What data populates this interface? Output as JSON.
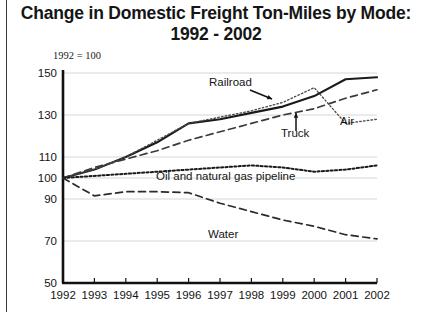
{
  "title": {
    "line1": "Change in Domestic Freight Ton-Miles by Mode:",
    "line2": "1992 - 2002"
  },
  "note": "1992 = 100",
  "chart_data": {
    "type": "line",
    "title": "Change in Domestic Freight Ton-Miles by Mode: 1992 - 2002",
    "subtitle": "1992 = 100",
    "xlabel": "",
    "ylabel": "",
    "grid": true,
    "legend_position": "inline-annotations",
    "x": [
      1992,
      1993,
      1994,
      1995,
      1996,
      1997,
      1998,
      1999,
      2000,
      2001,
      2002
    ],
    "xlim": [
      1992,
      2002
    ],
    "ylim": [
      50,
      150
    ],
    "yticks": [
      50,
      70,
      90,
      100,
      110,
      130,
      150
    ],
    "xticks": [
      "1992",
      "1993",
      "1994",
      "1995",
      "1996",
      "1997",
      "1998",
      "1999",
      "2000",
      "2001",
      "2002"
    ],
    "series": [
      {
        "name": "Railroad",
        "style": "solid",
        "color": "#1a1a1a",
        "values": [
          100,
          104,
          110,
          117,
          126,
          128,
          131,
          134,
          139,
          147,
          148
        ]
      },
      {
        "name": "Truck",
        "style": "dashed",
        "color": "#3a3a3a",
        "values": [
          100,
          105,
          109,
          113,
          118,
          122,
          126,
          130,
          133,
          138,
          142
        ]
      },
      {
        "name": "Air",
        "style": "dotted",
        "color": "#4a4a4a",
        "values": [
          100,
          104,
          110,
          118,
          126,
          129,
          132,
          136,
          143,
          126,
          128
        ]
      },
      {
        "name": "Oil and natural gas pipeline",
        "style": "dotted-thick",
        "color": "#1a1a1a",
        "values": [
          100,
          101,
          102,
          103,
          104,
          105,
          106,
          105,
          103,
          104,
          106
        ]
      },
      {
        "name": "Water",
        "style": "dashed",
        "color": "#2a2a2a",
        "values": [
          100,
          91.5,
          93.5,
          93.5,
          93,
          88,
          84,
          80,
          77,
          73,
          71
        ]
      }
    ],
    "annotations": [
      {
        "text": "Railroad",
        "target_series": "Railroad",
        "has_arrow": true
      },
      {
        "text": "Truck",
        "target_series": "Truck",
        "has_arrow": true
      },
      {
        "text": "Air",
        "target_series": "Air",
        "has_arrow": false
      },
      {
        "text": "Oil and natural gas pipeline",
        "target_series": "Oil and natural gas pipeline",
        "has_arrow": false
      },
      {
        "text": "Water",
        "target_series": "Water",
        "has_arrow": false
      }
    ]
  },
  "labels": {
    "railroad": "Railroad",
    "truck": "Truck",
    "air": "Air",
    "pipeline": "Oil and natural gas pipeline",
    "water": "Water"
  }
}
